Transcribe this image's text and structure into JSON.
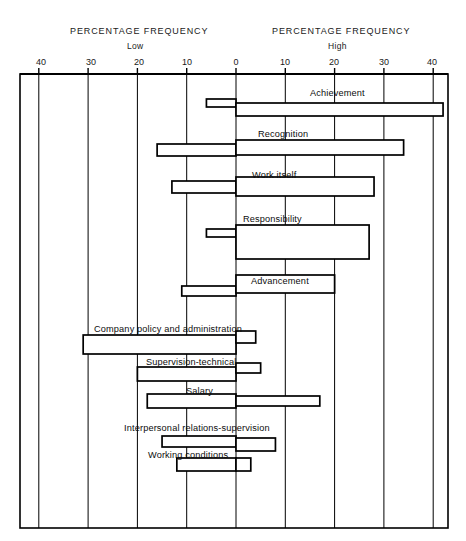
{
  "headers": {
    "left_title": "PERCENTAGE FREQUENCY",
    "left_sub": "Low",
    "right_title": "PERCENTAGE FREQUENCY",
    "right_sub": "High"
  },
  "axis": {
    "tick_labels": [
      "40",
      "30",
      "20",
      "10",
      "0",
      "10",
      "20",
      "30",
      "40"
    ],
    "tick_values": [
      -40,
      -30,
      -20,
      -10,
      0,
      10,
      20,
      30,
      40
    ]
  },
  "labels": {
    "achievement": "Achievement",
    "recognition": "Recognition",
    "work_itself": "Work itself",
    "responsibility": "Responsibility",
    "advancement": "Advancement",
    "company_policy": "Company policy and administration",
    "supervision": "Supervision-technical",
    "salary": "Salary",
    "interpersonal": "Interpersonal relations-supervision",
    "working_conditions": "Working conditions"
  },
  "chart_data": {
    "type": "bar",
    "title": "",
    "xlabel": "PERCENTAGE FREQUENCY",
    "ylabel": "",
    "xlim": [
      -43,
      43
    ],
    "grid": true,
    "legend": "none",
    "orientation": "horizontal",
    "axis_note": "Left half = Low (dissatisfier) percentage frequency; right half = High (satisfier) percentage frequency; both axes run 0 at center out to 40.",
    "categories": [
      "Achievement",
      "Recognition",
      "Work itself",
      "Responsibility",
      "Advancement",
      "Company policy and administration",
      "Supervision-technical",
      "Salary",
      "Interpersonal relations-supervision",
      "Working conditions"
    ],
    "series": [
      {
        "name": "Low",
        "values": [
          6,
          16,
          13,
          6,
          11,
          31,
          20,
          18,
          15,
          12
        ]
      },
      {
        "name": "High",
        "values": [
          42,
          34,
          28,
          27,
          20,
          4,
          5,
          17,
          8,
          3
        ]
      }
    ]
  },
  "geometry": {
    "plot": {
      "x0": 20,
      "y0": 74,
      "x1": 448,
      "y1": 528
    },
    "zero_x": 236,
    "px_per_unit": 4.93,
    "bars": [
      {
        "key": "achievement",
        "low_top": 99,
        "low_h": 8,
        "high_top": 103,
        "high_h": 13
      },
      {
        "key": "recognition",
        "low_top": 144,
        "low_h": 12,
        "high_top": 140,
        "high_h": 15
      },
      {
        "key": "work_itself",
        "low_top": 181,
        "low_h": 12,
        "high_top": 177,
        "high_h": 19
      },
      {
        "key": "responsibility",
        "low_top": 229,
        "low_h": 8,
        "high_top": 225,
        "high_h": 34
      },
      {
        "key": "advancement",
        "low_top": 286,
        "low_h": 10,
        "high_top": 275,
        "high_h": 18
      },
      {
        "key": "company_policy",
        "low_top": 335,
        "low_h": 19,
        "high_top": 331,
        "high_h": 12
      },
      {
        "key": "supervision",
        "low_top": 367,
        "low_h": 14,
        "high_top": 363,
        "high_h": 10
      },
      {
        "key": "salary",
        "low_top": 394,
        "low_h": 14,
        "high_top": 396,
        "high_h": 10
      },
      {
        "key": "interpersonal",
        "low_top": 436,
        "low_h": 11,
        "high_top": 438,
        "high_h": 13
      },
      {
        "key": "working_conditions",
        "low_top": 458,
        "low_h": 13,
        "high_top": 458,
        "high_h": 13
      }
    ],
    "bar_label_positions": [
      {
        "key": "achievement",
        "x": 310,
        "y": 88
      },
      {
        "key": "recognition",
        "x": 258,
        "y": 129
      },
      {
        "key": "work_itself",
        "x": 252,
        "y": 170
      },
      {
        "key": "responsibility",
        "x": 243,
        "y": 214
      },
      {
        "key": "advancement",
        "x": 251,
        "y": 276
      },
      {
        "key": "company_policy",
        "x": 94,
        "y": 324
      },
      {
        "key": "supervision",
        "x": 146,
        "y": 357
      },
      {
        "key": "salary",
        "x": 186,
        "y": 386
      },
      {
        "key": "interpersonal",
        "x": 124,
        "y": 423
      },
      {
        "key": "working_conditions",
        "x": 148,
        "y": 450
      }
    ]
  }
}
